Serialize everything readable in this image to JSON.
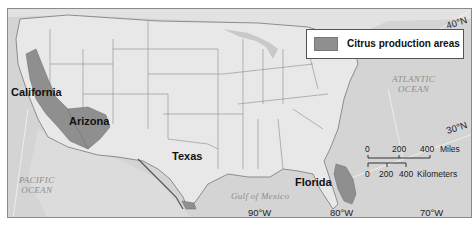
{
  "map": {
    "title": "Citrus production areas in the United States",
    "colors": {
      "land": "#e4e4e4",
      "ocean": "#d3d3d3",
      "citrus": "#8f8f8f",
      "border": "#666666",
      "frame": "#8a8a8a"
    },
    "legend": {
      "swatch_label": "Citrus production areas"
    },
    "states": [
      {
        "name": "California"
      },
      {
        "name": "Arizona"
      },
      {
        "name": "Texas"
      },
      {
        "name": "Florida"
      }
    ],
    "oceans": {
      "atlantic_line1": "ATLANTIC",
      "atlantic_line2": "OCEAN",
      "pacific_line1": "PACIFIC",
      "pacific_line2": "OCEAN",
      "gulf": "Gulf of Mexico"
    },
    "coordinates": {
      "lat_40": "40°N",
      "lat_30": "30°N",
      "lon_90": "90°W",
      "lon_80": "80°W",
      "lon_70": "70°W"
    },
    "scale_bar": {
      "miles_ticks": [
        "0",
        "200",
        "400"
      ],
      "miles_unit": "Miles",
      "km_ticks": [
        "0",
        "200",
        "400"
      ],
      "km_unit": "Kilometers"
    }
  }
}
